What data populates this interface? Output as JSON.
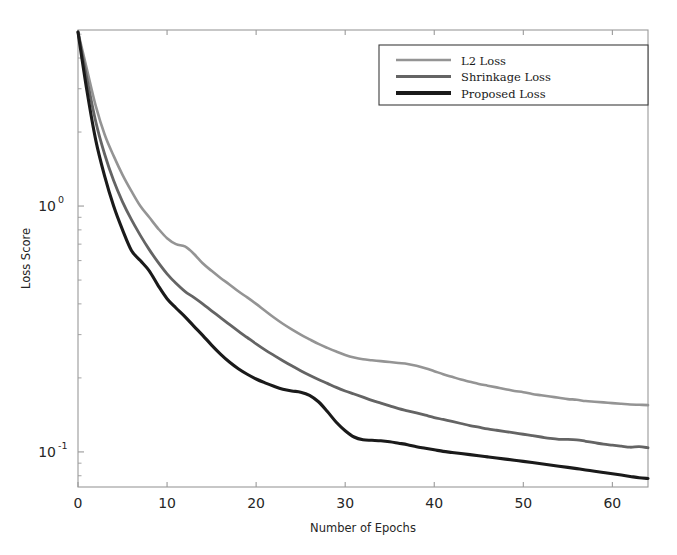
{
  "chart_data": {
    "type": "line",
    "title": "",
    "xlabel": "Number of Epochs",
    "ylabel": "Loss Score",
    "xlim": [
      0,
      64
    ],
    "ylim": [
      0.072,
      5.2
    ],
    "yscale": "log",
    "xscale": "linear",
    "grid": false,
    "legend_position": "upper right",
    "xticks": [
      0,
      10,
      20,
      30,
      40,
      50,
      60
    ],
    "xtick_labels": [
      "0",
      "10",
      "20",
      "30",
      "40",
      "50",
      "60"
    ],
    "yticks": [
      1,
      0.1
    ],
    "ytick_labels": [
      "10^0",
      "10^-1"
    ],
    "ytick_label_parts": [
      {
        "base": "10",
        "exp": "0"
      },
      {
        "base": "10",
        "exp": "-1"
      }
    ],
    "x": [
      0,
      1,
      2,
      3,
      4,
      5,
      6,
      7,
      8,
      9,
      10,
      11,
      12,
      13,
      14,
      15,
      16,
      17,
      18,
      19,
      20,
      21,
      22,
      23,
      24,
      25,
      26,
      27,
      28,
      29,
      30,
      31,
      32,
      33,
      34,
      35,
      36,
      37,
      38,
      39,
      40,
      41,
      42,
      43,
      44,
      45,
      46,
      47,
      48,
      49,
      50,
      51,
      52,
      53,
      54,
      55,
      56,
      57,
      58,
      59,
      60,
      61,
      62,
      63,
      64
    ],
    "series": [
      {
        "name": "L2 Loss",
        "color": "#949494",
        "width": 2.6,
        "values": [
          5.1,
          3.6,
          2.55,
          1.95,
          1.6,
          1.34,
          1.15,
          1.0,
          0.9,
          0.81,
          0.74,
          0.7,
          0.685,
          0.64,
          0.585,
          0.545,
          0.51,
          0.48,
          0.45,
          0.425,
          0.4,
          0.375,
          0.352,
          0.332,
          0.315,
          0.3,
          0.287,
          0.275,
          0.265,
          0.256,
          0.248,
          0.242,
          0.238,
          0.236,
          0.234,
          0.232,
          0.23,
          0.228,
          0.224,
          0.219,
          0.213,
          0.207,
          0.202,
          0.197,
          0.193,
          0.189,
          0.186,
          0.183,
          0.18,
          0.177,
          0.175,
          0.172,
          0.17,
          0.168,
          0.166,
          0.164,
          0.163,
          0.161,
          0.16,
          0.159,
          0.158,
          0.157,
          0.156,
          0.1555,
          0.155
        ]
      },
      {
        "name": "Shrinkage Loss",
        "color": "#646464",
        "width": 2.8,
        "values": [
          5.1,
          3.3,
          2.2,
          1.62,
          1.27,
          1.04,
          0.88,
          0.76,
          0.665,
          0.59,
          0.53,
          0.485,
          0.45,
          0.425,
          0.4,
          0.375,
          0.352,
          0.33,
          0.31,
          0.292,
          0.275,
          0.26,
          0.247,
          0.235,
          0.224,
          0.214,
          0.205,
          0.197,
          0.19,
          0.183,
          0.177,
          0.172,
          0.167,
          0.162,
          0.158,
          0.154,
          0.15,
          0.147,
          0.144,
          0.141,
          0.138,
          0.1355,
          0.133,
          0.1305,
          0.128,
          0.126,
          0.124,
          0.1225,
          0.121,
          0.1195,
          0.118,
          0.1165,
          0.115,
          0.1135,
          0.1125,
          0.1125,
          0.112,
          0.1105,
          0.109,
          0.1075,
          0.1065,
          0.1055,
          0.1045,
          0.105,
          0.104
        ]
      },
      {
        "name": "Proposed Loss",
        "color": "#1a1a1a",
        "width": 3.1,
        "values": [
          5.1,
          2.95,
          1.85,
          1.32,
          1.0,
          0.8,
          0.66,
          0.6,
          0.545,
          0.475,
          0.42,
          0.385,
          0.355,
          0.325,
          0.298,
          0.272,
          0.25,
          0.232,
          0.218,
          0.207,
          0.198,
          0.191,
          0.185,
          0.18,
          0.177,
          0.175,
          0.17,
          0.16,
          0.146,
          0.132,
          0.122,
          0.115,
          0.112,
          0.1115,
          0.111,
          0.11,
          0.1085,
          0.107,
          0.105,
          0.1035,
          0.102,
          0.1005,
          0.0995,
          0.0985,
          0.0975,
          0.0965,
          0.0955,
          0.0945,
          0.0935,
          0.0925,
          0.0915,
          0.0905,
          0.0895,
          0.0885,
          0.0875,
          0.0865,
          0.0855,
          0.0845,
          0.0835,
          0.0825,
          0.0815,
          0.0805,
          0.0795,
          0.0785,
          0.078
        ]
      }
    ],
    "legend_entries": [
      {
        "label": "L2 Loss",
        "color": "#949494",
        "width": 2.4
      },
      {
        "label": "Shrinkage Loss",
        "color": "#646464",
        "width": 3.0
      },
      {
        "label": "Proposed Loss",
        "color": "#1a1a1a",
        "width": 4.0
      }
    ]
  }
}
